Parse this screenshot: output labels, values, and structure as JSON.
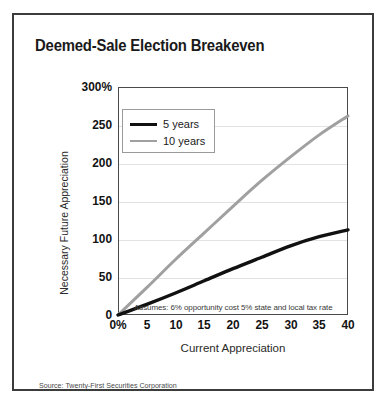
{
  "chart_data": {
    "type": "line",
    "title": "Deemed-Sale Election Breakeven",
    "xlabel": "Current Appreciation",
    "ylabel": "Necessary Future Appreciation",
    "xlim": [
      0,
      40
    ],
    "ylim": [
      0,
      300
    ],
    "grid": true,
    "legend_position": "upper-left",
    "x_tick_labels": [
      "0%",
      "5",
      "10",
      "15",
      "20",
      "25",
      "30",
      "35",
      "40"
    ],
    "x_tick_values": [
      0,
      5,
      10,
      15,
      20,
      25,
      30,
      35,
      40
    ],
    "y_tick_labels": [
      "300%",
      "250",
      "200",
      "150",
      "100",
      "50",
      "0"
    ],
    "y_tick_values": [
      300,
      250,
      200,
      150,
      100,
      50,
      0
    ],
    "annotation": "Assumes: 6% opportunity cost 5% state and local tax rate",
    "source": "Source: Twenty-First Securities Corporation",
    "x": [
      0,
      5,
      10,
      15,
      20,
      25,
      30,
      35,
      40
    ],
    "series": [
      {
        "name": "5 years",
        "color": "#111111",
        "width": 3.4,
        "values": [
          0,
          14,
          29,
          45,
          61,
          76,
          91,
          103,
          112
        ]
      },
      {
        "name": "10 years",
        "color": "#a0a0a0",
        "width": 3.0,
        "values": [
          0,
          36,
          73,
          108,
          143,
          177,
          208,
          237,
          262
        ]
      }
    ]
  },
  "legend": {
    "items": [
      {
        "label": "5 years"
      },
      {
        "label": "10 years"
      }
    ]
  }
}
